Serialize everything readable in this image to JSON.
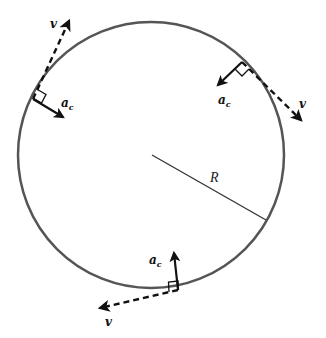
{
  "diagram": {
    "colors": {
      "circle": "#555555",
      "arrow": "#111111",
      "radius": "#333333",
      "background": "#ffffff"
    },
    "circle": {
      "cx": 151,
      "cy": 155,
      "r": 133
    },
    "radius": {
      "label": "R",
      "from": [
        152,
        155
      ],
      "to": [
        266,
        220
      ]
    },
    "points": [
      {
        "name": "upper-left",
        "velocity": {
          "label": "v",
          "from": [
            33,
            99
          ],
          "to": [
            70,
            19
          ]
        },
        "acceleration": {
          "label": "a",
          "sub": "c",
          "from": [
            33,
            99
          ],
          "to": [
            64,
            118
          ]
        }
      },
      {
        "name": "upper-right",
        "velocity": {
          "label": "v",
          "from": [
            242,
            62
          ],
          "to": [
            303,
            122
          ]
        },
        "acceleration": {
          "label": "a",
          "sub": "c",
          "from": [
            242,
            62
          ],
          "to": [
            216,
            87
          ]
        }
      },
      {
        "name": "bottom",
        "velocity": {
          "label": "v",
          "from": [
            178,
            290
          ],
          "to": [
            98,
            309
          ]
        },
        "acceleration": {
          "label": "a",
          "sub": "c",
          "from": [
            178,
            290
          ],
          "to": [
            174,
            251
          ]
        }
      }
    ]
  }
}
